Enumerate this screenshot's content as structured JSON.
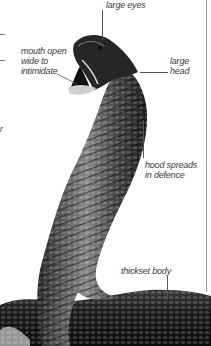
{
  "figure": {
    "labels": {
      "large_eyes": "large eyes",
      "mouth_open": "mouth open\nwide to\nintimidate",
      "large_head": "large\nhead",
      "hood_spreads": "hood spreads\nin defence",
      "thickset_body": "thickset body"
    },
    "left_margin_fragment": "r"
  },
  "colors": {
    "background": "#ffffff",
    "label_text": "#3a3a3a",
    "leader_line": "#555555",
    "snake_dark": "#1a1a1a",
    "snake_mid": "#5a5a5a",
    "snake_light": "#bdbdbd"
  }
}
